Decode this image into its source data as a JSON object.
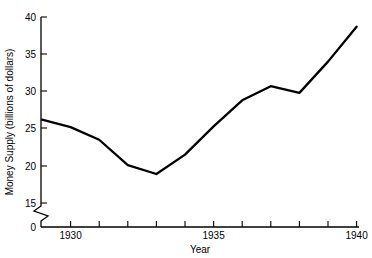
{
  "chart_data": {
    "type": "line",
    "title": "",
    "xlabel": "Year",
    "ylabel": "Money Supply (billions of dollars)",
    "x": [
      1929,
      1930,
      1931,
      1932,
      1933,
      1934,
      1935,
      1936,
      1937,
      1938,
      1939,
      1940
    ],
    "values": [
      26.2,
      25.2,
      23.5,
      20.1,
      18.9,
      21.5,
      25.3,
      28.8,
      30.7,
      29.8,
      34.0,
      38.7
    ],
    "series": [
      {
        "name": "Money Supply",
        "values": [
          26.2,
          25.2,
          23.5,
          20.1,
          18.9,
          21.5,
          25.3,
          28.8,
          30.7,
          29.8,
          34.0,
          38.7
        ]
      }
    ],
    "xlim": [
      1928.95,
      1940
    ],
    "ylim": [
      0,
      40
    ],
    "y_axis_break": true,
    "y_axis_break_between": [
      0,
      15
    ],
    "grid": false,
    "legend": false,
    "legend_position": "none",
    "xticks": [
      1929,
      1930,
      1931,
      1932,
      1933,
      1934,
      1935,
      1936,
      1937,
      1938,
      1939,
      1940
    ],
    "xtick_labels_shown": [
      "1930",
      "1935",
      "1940"
    ],
    "yticks": [
      0,
      15,
      20,
      25,
      30,
      35,
      40
    ],
    "ytick_labels": [
      "0",
      "15",
      "20",
      "25",
      "30",
      "35",
      "40"
    ],
    "line_color": "#000000"
  },
  "axes": {
    "y_label": "Money Supply (billions of dollars)",
    "x_label": "Year",
    "y_ticks": [
      {
        "label": "40"
      },
      {
        "label": "35"
      },
      {
        "label": "30"
      },
      {
        "label": "25"
      },
      {
        "label": "20"
      },
      {
        "label": "15"
      },
      {
        "label": "0"
      }
    ],
    "x_ticks": [
      {
        "label": "1930"
      },
      {
        "label": "1935"
      },
      {
        "label": "1940"
      }
    ]
  }
}
